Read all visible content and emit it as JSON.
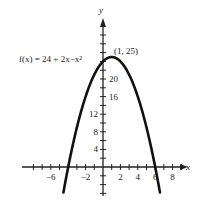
{
  "chart_data": {
    "type": "line",
    "title": "",
    "function_label": "f(x) = 24 + 2x−x²",
    "vertex_label": "(1, 25)",
    "xlabel": "x",
    "ylabel": "y",
    "xlim": [
      -8.5,
      9.5
    ],
    "ylim": [
      -6,
      30
    ],
    "x_tick_labels": [
      "−6",
      "−2",
      "2",
      "4",
      "6",
      "8"
    ],
    "x_tick_values": [
      -6,
      -2,
      2,
      4,
      6,
      8
    ],
    "y_tick_labels": [
      "4",
      "8",
      "12",
      "16",
      "20"
    ],
    "y_tick_values": [
      4,
      8,
      12,
      16,
      20
    ],
    "grid": false,
    "series": [
      {
        "name": "f(x) = 24 + 2x - x^2",
        "x": [
          -4.6,
          -4,
          -3,
          -2,
          -1,
          0,
          1,
          2,
          3,
          4,
          5,
          6,
          6.6
        ],
        "y": [
          -7.4,
          0,
          9,
          16,
          21,
          24,
          25,
          24,
          21,
          16,
          9,
          0,
          -7.4
        ]
      }
    ],
    "annotations": [
      {
        "text": "(1, 25)",
        "x": 1,
        "y": 25
      },
      {
        "text": "f(x) = 24 + 2x−x²",
        "position": "left of y-axis near top"
      }
    ]
  }
}
